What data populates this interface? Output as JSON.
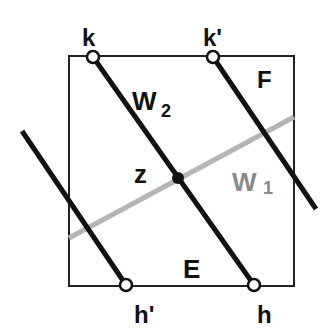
{
  "diagram": {
    "labels": {
      "k": "k",
      "k_prime": "k'",
      "h": "h",
      "h_prime": "h'",
      "z": "z",
      "E": "E",
      "F": "F",
      "W2": "W",
      "W2_sub": "2",
      "W1": "W",
      "W1_sub": "1"
    },
    "colors": {
      "line": "#111111",
      "gray_line": "#b5b5b5",
      "gray_label": "#8a8a8a",
      "frame": "#222222"
    }
  }
}
